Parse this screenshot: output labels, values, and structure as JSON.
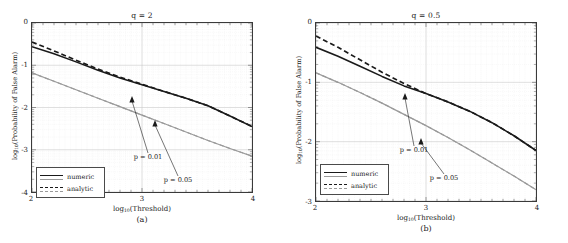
{
  "top_partial_text": "",
  "figure": {
    "panels": [
      {
        "id": "panel-a",
        "title": "q = 2",
        "subcaption": "(a)",
        "xlabel_prefix": "log",
        "xlabel_sub": "10",
        "xlabel_suffix": "(Threshold)",
        "ylabel_prefix": "log",
        "ylabel_sub": "10",
        "ylabel_suffix": "(Probability of False Alarm)",
        "xticks": [
          "2",
          "3",
          "4"
        ],
        "yticks": [
          "0",
          "-1",
          "-2",
          "-3",
          "-4"
        ],
        "legend": [
          {
            "label": "numeric",
            "style": "solid"
          },
          {
            "label": "analytic",
            "style": "dashed"
          }
        ],
        "annotations": [
          {
            "text": "p = 0.01"
          },
          {
            "text": "p = 0.05"
          }
        ]
      },
      {
        "id": "panel-b",
        "title": "q = 0.5",
        "subcaption": "(b)",
        "xlabel_prefix": "log",
        "xlabel_sub": "10",
        "xlabel_suffix": "(Threshold)",
        "ylabel_prefix": "log",
        "ylabel_sub": "10",
        "ylabel_suffix": "(Probability of False Alarm)",
        "xticks": [
          "2",
          "3",
          "4"
        ],
        "yticks": [
          "0",
          "-1",
          "-2",
          "-3"
        ],
        "legend": [
          {
            "label": "numeric",
            "style": "solid"
          },
          {
            "label": "analytic",
            "style": "dashed"
          }
        ],
        "annotations": [
          {
            "text": "p = 0.01"
          },
          {
            "text": "p = 0.05"
          }
        ]
      }
    ]
  },
  "colors": {
    "black": "#1a1a1a",
    "gray": "#9a9a9a",
    "grid_major": "#c8c8c8",
    "grid_minor": "#e2e2e2",
    "axis": "#3a3a3a",
    "background": "#ffffff"
  },
  "chart_data": [
    {
      "type": "line",
      "title": "q = 2",
      "subcaption": "(a)",
      "xlabel": "log10(Threshold)",
      "ylabel": "log10(Probability of False Alarm)",
      "xlim": [
        2,
        4
      ],
      "ylim": [
        -4,
        0
      ],
      "xticks": [
        2,
        3,
        4
      ],
      "yticks": [
        0,
        -1,
        -2,
        -3,
        -4
      ],
      "grid": true,
      "legend_position": "lower-left",
      "annotations": [
        {
          "text": "p = 0.01",
          "points_to_series": "p=0.01 numeric",
          "arrow_tip_x": 3.0,
          "arrow_tip_y": -1.45,
          "label_x": 2.95,
          "label_y": -2.78
        },
        {
          "text": "p = 0.05",
          "points_to_series": "p=0.05 numeric",
          "arrow_tip_x": 3.2,
          "arrow_tip_y": -2.46,
          "label_x": 3.2,
          "label_y": -3.38
        }
      ],
      "series": [
        {
          "name": "p=0.01 numeric",
          "style": "solid",
          "color": "#1a1a1a",
          "x": [
            2.0,
            2.2,
            2.4,
            2.6,
            2.8,
            3.0,
            3.2,
            3.4,
            3.6,
            3.8,
            4.0
          ],
          "y": [
            -0.56,
            -0.73,
            -0.92,
            -1.12,
            -1.3,
            -1.46,
            -1.62,
            -1.78,
            -1.96,
            -2.2,
            -2.45
          ]
        },
        {
          "name": "p=0.01 analytic",
          "style": "dashed",
          "color": "#1a1a1a",
          "x": [
            2.0,
            2.2,
            2.4,
            2.6,
            2.8,
            3.0,
            3.2,
            3.4,
            3.6,
            3.8,
            4.0
          ],
          "y": [
            -0.45,
            -0.66,
            -0.88,
            -1.09,
            -1.28,
            -1.45,
            -1.62,
            -1.78,
            -1.96,
            -2.2,
            -2.45
          ]
        },
        {
          "name": "p=0.05 numeric",
          "style": "solid",
          "color": "#9a9a9a",
          "x": [
            2.0,
            2.2,
            2.4,
            2.6,
            2.8,
            3.0,
            3.2,
            3.4,
            3.6,
            3.8,
            4.0
          ],
          "y": [
            -1.18,
            -1.38,
            -1.58,
            -1.78,
            -1.98,
            -2.18,
            -2.38,
            -2.58,
            -2.78,
            -2.97,
            -3.15
          ]
        },
        {
          "name": "p=0.05 analytic",
          "style": "dashed",
          "color": "#9a9a9a",
          "x": [
            2.0,
            2.2,
            2.4,
            2.6,
            2.8,
            3.0,
            3.2,
            3.4,
            3.6,
            3.8,
            4.0
          ],
          "y": [
            -1.18,
            -1.38,
            -1.58,
            -1.78,
            -1.98,
            -2.18,
            -2.38,
            -2.58,
            -2.78,
            -2.97,
            -3.15
          ]
        }
      ]
    },
    {
      "type": "line",
      "title": "q = 0.5",
      "subcaption": "(b)",
      "xlabel": "log10(Threshold)",
      "ylabel": "log10(Probability of False Alarm)",
      "xlim": [
        2,
        4
      ],
      "ylim": [
        -3,
        0
      ],
      "xticks": [
        2,
        3,
        4
      ],
      "yticks": [
        0,
        -1,
        -2,
        -3
      ],
      "grid": true,
      "legend_position": "lower-left",
      "annotations": [
        {
          "text": "p = 0.01",
          "points_to_series": "p=0.01 numeric",
          "arrow_tip_x": 2.96,
          "arrow_tip_y": -1.16,
          "label_x": 2.96,
          "label_y": -2.13
        },
        {
          "text": "p = 0.05",
          "points_to_series": "p=0.05 numeric",
          "arrow_tip_x": 3.2,
          "arrow_tip_y": -2.06,
          "label_x": 3.2,
          "label_y": -2.59
        }
      ],
      "series": [
        {
          "name": "p=0.01 numeric",
          "style": "solid",
          "color": "#1a1a1a",
          "x": [
            2.0,
            2.2,
            2.4,
            2.6,
            2.8,
            3.0,
            3.2,
            3.4,
            3.6,
            3.8,
            4.0
          ],
          "y": [
            -0.41,
            -0.56,
            -0.73,
            -0.9,
            -1.06,
            -1.19,
            -1.33,
            -1.49,
            -1.68,
            -1.9,
            -2.15
          ]
        },
        {
          "name": "p=0.01 analytic",
          "style": "dashed",
          "color": "#1a1a1a",
          "x": [
            2.0,
            2.2,
            2.4,
            2.6,
            2.8,
            3.0,
            3.2,
            3.4,
            3.6,
            3.8,
            4.0
          ],
          "y": [
            -0.22,
            -0.41,
            -0.62,
            -0.83,
            -1.02,
            -1.19,
            -1.33,
            -1.49,
            -1.68,
            -1.9,
            -2.15
          ]
        },
        {
          "name": "p=0.05 numeric",
          "style": "solid",
          "color": "#9a9a9a",
          "x": [
            2.0,
            2.2,
            2.4,
            2.6,
            2.8,
            3.0,
            3.2,
            3.4,
            3.6,
            3.8,
            4.0
          ],
          "y": [
            -0.84,
            -1.0,
            -1.17,
            -1.35,
            -1.54,
            -1.73,
            -1.93,
            -2.14,
            -2.36,
            -2.58,
            -2.81
          ]
        },
        {
          "name": "p=0.05 analytic",
          "style": "dashed",
          "color": "#9a9a9a",
          "x": [
            2.0,
            2.2,
            2.4,
            2.6,
            2.8,
            3.0,
            3.2,
            3.4,
            3.6,
            3.8,
            4.0
          ],
          "y": [
            -0.84,
            -1.0,
            -1.17,
            -1.35,
            -1.54,
            -1.73,
            -1.93,
            -2.14,
            -2.36,
            -2.58,
            -2.81
          ]
        }
      ]
    }
  ]
}
